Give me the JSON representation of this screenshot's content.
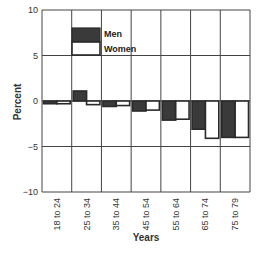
{
  "chart_data": {
    "type": "bar",
    "title": "",
    "xlabel": "Years",
    "ylabel": "Percent",
    "ylim": [
      -10,
      10
    ],
    "yticks": [
      10,
      5,
      0,
      -5,
      -10
    ],
    "ytick_labels": [
      "10",
      "5",
      "0",
      "−5",
      "−10"
    ],
    "grid": true,
    "legend_position": "upper-left-inside",
    "categories": [
      "18 to 24",
      "25 to 34",
      "35 to 44",
      "45 to 54",
      "55 to 64",
      "65 to 74",
      "75 to 79"
    ],
    "series": [
      {
        "name": "Men",
        "color": "#3a3a3a",
        "values": [
          -0.3,
          1.1,
          -0.6,
          -1.1,
          -2.1,
          -3.1,
          -4.0
        ]
      },
      {
        "name": "Women",
        "color": "#ffffff",
        "values": [
          -0.3,
          -0.4,
          -0.5,
          -1.0,
          -2.0,
          -4.1,
          -4.0
        ]
      }
    ]
  },
  "legend": {
    "men_label": "Men",
    "women_label": "Women"
  },
  "axes": {
    "x_title": "Years",
    "y_title": "Percent"
  },
  "colors": {
    "men_fill": "#3a3a3a",
    "women_fill": "#ffffff",
    "outline": "#2a2a2a",
    "grid": "#444444"
  }
}
